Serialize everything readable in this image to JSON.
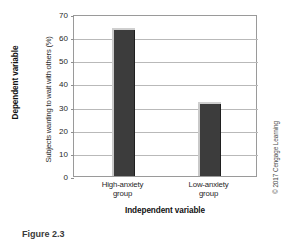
{
  "figure": {
    "caption": "Figure 2.3",
    "credit": "© 2017 Cengage Learning",
    "outer_y_title": "Dependent variable",
    "outer_x_title": "Independent variable"
  },
  "chart_data": {
    "type": "bar",
    "title": "",
    "xlabel": "Independent variable",
    "ylabel": "Subjects wanting to wait with others (%)",
    "categories": [
      "High-anxiety group",
      "Low-anxiety group"
    ],
    "category_lines": [
      [
        "High-anxiety",
        "group"
      ],
      [
        "Low-anxiety",
        "group"
      ]
    ],
    "values": [
      63,
      31
    ],
    "ylim": [
      0,
      70
    ],
    "yticks": [
      70,
      60,
      50,
      40,
      30,
      20,
      10,
      0
    ],
    "ytick_labels": [
      "70",
      "60",
      "50",
      "40",
      "30",
      "20",
      "10",
      "0"
    ],
    "grid": true,
    "legend": "none",
    "bar_color": "#3c3c3c",
    "bar_highlight_color": "#cfcfcf",
    "grid_color": "#b9b9b9",
    "axis_color": "#9a9a9a"
  }
}
